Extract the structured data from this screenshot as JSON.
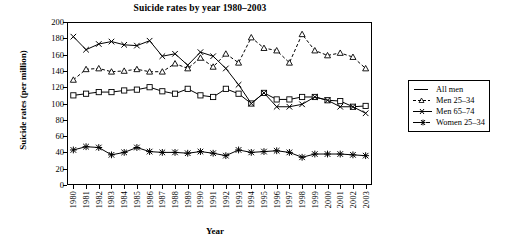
{
  "chart_data": {
    "type": "line",
    "title": "Suicide rates by year 1980–2003",
    "xlabel": "Year",
    "ylabel": "Suicide rates (per million)",
    "grid": false,
    "legend_position": "right-outside",
    "ylim": [
      0,
      200
    ],
    "yticks": [
      0,
      20,
      40,
      60,
      80,
      100,
      120,
      140,
      160,
      180,
      200
    ],
    "categories": [
      "1980",
      "1981",
      "1982",
      "1983",
      "1984",
      "1985",
      "1986",
      "1987",
      "1988",
      "1989",
      "1990",
      "1991",
      "1992",
      "1993",
      "1994",
      "1995",
      "1996",
      "1997",
      "1998",
      "1999",
      "2000",
      "2001",
      "2002",
      "2003"
    ],
    "series": [
      {
        "name": "All  men",
        "marker": "square",
        "line": "solid",
        "values": [
          110,
          112,
          114,
          114,
          116,
          117,
          120,
          115,
          112,
          118,
          110,
          108,
          118,
          112,
          100,
          113,
          105,
          105,
          108,
          108,
          104,
          103,
          96,
          97
        ]
      },
      {
        "name": "Men 25–34",
        "marker": "triangle",
        "line": "dashed",
        "values": [
          129,
          142,
          143,
          139,
          140,
          142,
          139,
          139,
          149,
          143,
          156,
          145,
          161,
          150,
          181,
          168,
          165,
          150,
          185,
          165,
          159,
          162,
          157,
          143
        ]
      },
      {
        "name": "Men 65–74",
        "marker": "x",
        "line": "solid",
        "values": [
          182,
          166,
          173,
          176,
          172,
          171,
          177,
          158,
          161,
          147,
          163,
          158,
          143,
          123,
          100,
          113,
          96,
          96,
          99,
          108,
          104,
          96,
          96,
          88
        ]
      },
      {
        "name": "Women 25–34",
        "marker": "star",
        "line": "solid",
        "values": [
          43,
          47,
          46,
          37,
          40,
          46,
          41,
          40,
          40,
          39,
          41,
          39,
          36,
          43,
          40,
          41,
          42,
          40,
          34,
          38,
          38,
          38,
          37,
          36
        ]
      }
    ]
  },
  "legend": {
    "items": [
      {
        "label": "All  men"
      },
      {
        "label": "Men 25–34"
      },
      {
        "label": "Men 65–74"
      },
      {
        "label": "Women 25–34"
      }
    ]
  }
}
